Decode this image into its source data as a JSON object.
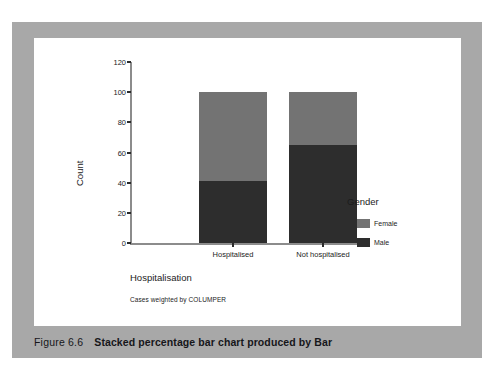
{
  "figure": {
    "number_label": "Figure 6.6",
    "caption": "Stacked percentage bar chart produced by Bar"
  },
  "colors": {
    "frame": "#a8a8a8",
    "plate": "#ffffff",
    "female": "#737373",
    "male": "#2d2d2d",
    "axis": "#8c8c8c",
    "text": "#1c1c1c"
  },
  "legend": {
    "title": "Gender",
    "entries": [
      {
        "label": "Female",
        "color": "#737373"
      },
      {
        "label": "Male",
        "color": "#2d2d2d"
      }
    ]
  },
  "footnote": "Cases weighted by COLUMPER",
  "chart_data": {
    "type": "bar",
    "title": "",
    "xlabel": "Hospitalisation",
    "ylabel": "Count",
    "categories": [
      "Hospitalised",
      "Not hospitalised"
    ],
    "ylim": [
      0,
      120
    ],
    "yticks": [
      0,
      20,
      40,
      60,
      80,
      100,
      120
    ],
    "grid": false,
    "stacked": true,
    "legend_position": "right",
    "series": [
      {
        "name": "Male",
        "color": "#2d2d2d",
        "values": [
          41,
          65
        ]
      },
      {
        "name": "Female",
        "color": "#737373",
        "values": [
          59,
          35
        ]
      }
    ],
    "totals": [
      100,
      100
    ],
    "annotation": "Cases weighted by COLUMPER"
  }
}
